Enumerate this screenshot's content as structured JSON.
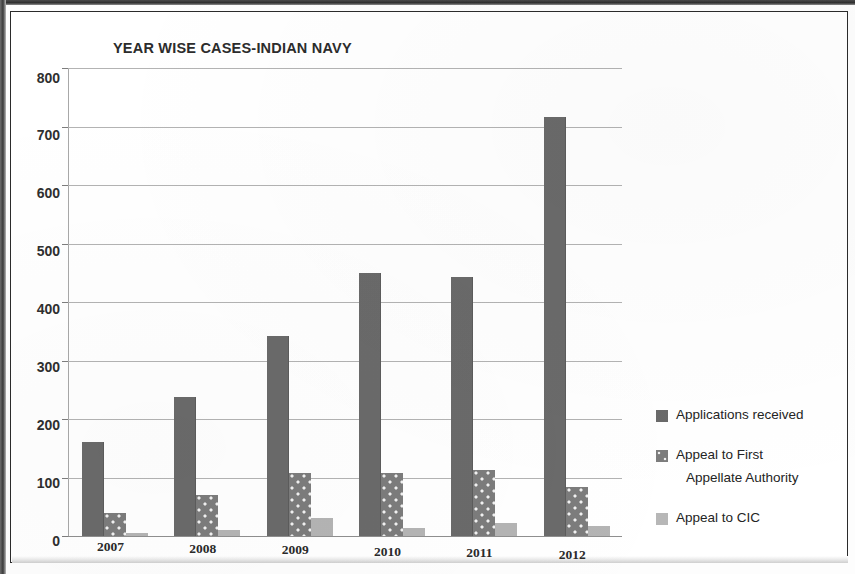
{
  "chart_data": {
    "type": "bar",
    "title": "YEAR WISE CASES-INDIAN NAVY",
    "xlabel": "",
    "ylabel": "",
    "categories": [
      "2007",
      "2008",
      "2009",
      "2010",
      "2011",
      "2012"
    ],
    "series": [
      {
        "name": "Applications received",
        "values": [
          160,
          237,
          342,
          450,
          442,
          717
        ],
        "color": "#6a6a6a",
        "fill": "solid"
      },
      {
        "name": "Appeal to First Appellate Authority",
        "values": [
          40,
          70,
          107,
          108,
          112,
          84
        ],
        "color": "#7c7c7c",
        "fill": "dotted"
      },
      {
        "name": "Appeal to CIC",
        "values": [
          5,
          10,
          30,
          14,
          22,
          17
        ],
        "color": "#b4b4b4",
        "fill": "solid-light"
      }
    ],
    "ylim": [
      0,
      800
    ],
    "ytick_step": 100,
    "yticks": [
      "800",
      "700",
      "600",
      "500",
      "400",
      "300",
      "200",
      "100",
      "0"
    ],
    "grid": true,
    "legend_position": "right"
  },
  "legend": {
    "entries": [
      {
        "label": "Applications received",
        "swatch": "dark-gray-swatch"
      },
      {
        "label": "Appeal to First",
        "label_line2": "Appellate Authority",
        "swatch": "dotted-gray-swatch"
      },
      {
        "label": "Appeal to CIC",
        "swatch": "light-gray-swatch"
      }
    ]
  }
}
